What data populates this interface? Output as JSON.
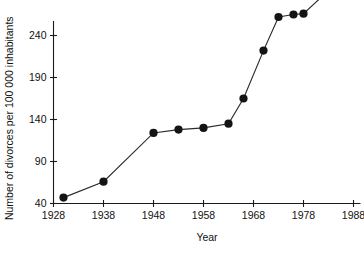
{
  "chart_data": {
    "type": "line",
    "title": "",
    "subtitle": "",
    "xlabel": "Year",
    "ylabel": "Number of divorces per 100 000 inhabitants",
    "xlim": [
      1928,
      1990
    ],
    "ylim": [
      40,
      310
    ],
    "grid": false,
    "legend": null,
    "xticks": [
      1928,
      1938,
      1948,
      1958,
      1968,
      1978,
      1988
    ],
    "xtick_labels": [
      "1928",
      "1938",
      "1948",
      "1958",
      "1968",
      "1978",
      "1988"
    ],
    "yticks": [
      40,
      90,
      140,
      190,
      240,
      290
    ],
    "ytick_labels": [
      "40",
      "90",
      "140",
      "190",
      "240",
      "290"
    ],
    "marker": "filled-circle",
    "marker_color": "#141414",
    "line_color": "#2b2b2b",
    "x": [
      1930,
      1938,
      1948,
      1953,
      1958,
      1963,
      1966,
      1970,
      1973,
      1976,
      1978,
      1984,
      1988
    ],
    "y": [
      47,
      66,
      124,
      128,
      130,
      135,
      165,
      222,
      262,
      265,
      266,
      299,
      306
    ],
    "points": [
      {
        "x": 1930,
        "y": 47
      },
      {
        "x": 1938,
        "y": 66
      },
      {
        "x": 1948,
        "y": 124
      },
      {
        "x": 1953,
        "y": 128
      },
      {
        "x": 1958,
        "y": 130
      },
      {
        "x": 1963,
        "y": 135
      },
      {
        "x": 1966,
        "y": 165
      },
      {
        "x": 1970,
        "y": 222
      },
      {
        "x": 1973,
        "y": 262
      },
      {
        "x": 1976,
        "y": 265
      },
      {
        "x": 1978,
        "y": 266
      },
      {
        "x": 1984,
        "y": 299
      },
      {
        "x": 1988,
        "y": 306
      }
    ]
  }
}
